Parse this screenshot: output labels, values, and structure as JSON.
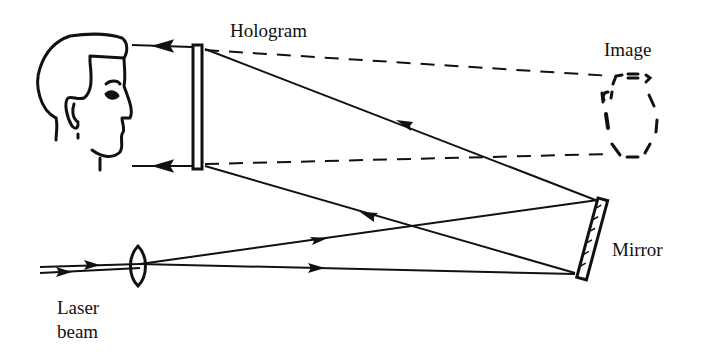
{
  "diagram": {
    "labels": {
      "hologram": "Hologram",
      "image": "Image",
      "mirror": "Mirror",
      "laser_line1": "Laser",
      "laser_line2": "beam"
    },
    "colors": {
      "ink": "#111111",
      "background": "#ffffff"
    },
    "components": [
      {
        "name": "viewer-head",
        "kind": "face-profile"
      },
      {
        "name": "hologram-plate",
        "kind": "plate"
      },
      {
        "name": "virtual-image",
        "kind": "dashed-vase"
      },
      {
        "name": "mirror",
        "kind": "mirror"
      },
      {
        "name": "lens",
        "kind": "converging-lens"
      },
      {
        "name": "laser-beam",
        "kind": "input-beam"
      }
    ]
  }
}
